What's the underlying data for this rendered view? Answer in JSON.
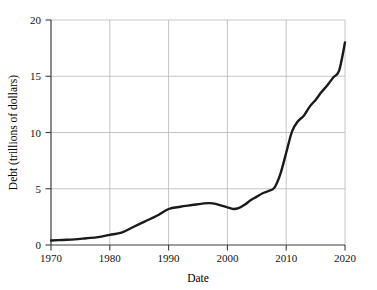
{
  "chart_data": {
    "type": "line",
    "title": "",
    "xlabel": "Date",
    "ylabel": "Debt (trillions of dollars)",
    "xlim": [
      1970,
      2020
    ],
    "ylim": [
      0,
      20
    ],
    "grid": true,
    "legend": "none",
    "xticks": [
      1970,
      1980,
      1990,
      2000,
      2010,
      2020
    ],
    "xtick_labels": [
      "1970",
      "1980",
      "1990",
      "2000",
      "2010",
      "2020"
    ],
    "yticks": [
      0,
      5,
      10,
      15,
      20
    ],
    "ytick_labels": [
      "0",
      "5",
      "10",
      "15",
      "20"
    ],
    "series": [
      {
        "name": "US national debt",
        "color": "#1a1a1a",
        "x": [
          1970,
          1972,
          1974,
          1976,
          1978,
          1980,
          1982,
          1984,
          1986,
          1988,
          1990,
          1992,
          1994,
          1996,
          1997,
          1998,
          1999,
          2000,
          2001,
          2002,
          2003,
          2004,
          2005,
          2006,
          2007,
          2008,
          2009,
          2010,
          2011,
          2012,
          2013,
          2014,
          2015,
          2016,
          2017,
          2018,
          2019,
          2020
        ],
        "values": [
          0.4,
          0.45,
          0.5,
          0.6,
          0.7,
          0.9,
          1.1,
          1.6,
          2.1,
          2.6,
          3.2,
          3.4,
          3.55,
          3.7,
          3.72,
          3.65,
          3.5,
          3.35,
          3.2,
          3.3,
          3.6,
          4.0,
          4.3,
          4.6,
          4.8,
          5.1,
          6.3,
          8.2,
          10.1,
          11.0,
          11.5,
          12.3,
          12.9,
          13.6,
          14.2,
          14.9,
          15.5,
          18.0
        ]
      }
    ]
  },
  "axes": {
    "x_title": "Date",
    "y_title": "Debt (trillions of dollars)"
  },
  "style": {
    "line_color": "#1a1a1a",
    "grid_color": "#b5b5b5",
    "axis_color": "#4a4a4a",
    "background": "#ffffff"
  }
}
